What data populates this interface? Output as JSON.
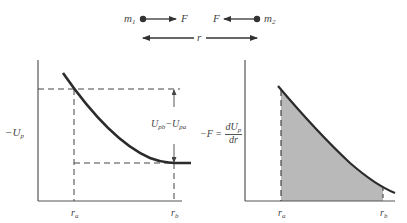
{
  "top_schematic": {
    "mass1_label": "m",
    "mass1_sub": "1",
    "mass2_label": "m",
    "mass2_sub": "2",
    "force1_label": "F",
    "force2_label": "F",
    "separation_label": "r"
  },
  "left_graph": {
    "y_axis_label_prefix": "−U",
    "y_axis_label_sub": "p",
    "difference_label_a": "U",
    "difference_label_a_sub": "pb",
    "difference_label_mid": "−",
    "difference_label_b": "U",
    "difference_label_b_sub": "pa",
    "x_tick_a": "r",
    "x_tick_a_sub": "a",
    "x_tick_b": "r",
    "x_tick_b_sub": "b"
  },
  "right_graph": {
    "y_axis_label_prefix": "−F =",
    "y_axis_numerator": "dU",
    "y_axis_numerator_sub": "p",
    "y_axis_denominator": "dr",
    "x_tick_a": "r",
    "x_tick_a_sub": "a",
    "x_tick_b": "r",
    "x_tick_b_sub": "b"
  },
  "colors": {
    "line": "#2b2b2b",
    "shade": "#b9b9b9",
    "axis": "#555555"
  }
}
